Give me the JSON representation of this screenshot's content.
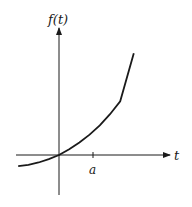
{
  "chart_data": {
    "type": "line",
    "title": "",
    "ylabel": "f(t)",
    "xlabel": "t",
    "x_ticks": [
      {
        "label": "a",
        "value": 1
      }
    ],
    "xlim": [
      -1.2,
      2.2
    ],
    "ylim": [
      -0.35,
      3.0
    ],
    "series": [
      {
        "name": "f(t)",
        "description": "increasing convex curve passing through origin",
        "x": [
          -1.2,
          -0.9,
          -0.6,
          -0.3,
          0,
          0.3,
          0.6,
          0.9,
          1.2,
          1.5,
          1.8,
          2.2
        ],
        "y": [
          -0.33,
          -0.29,
          -0.22,
          -0.12,
          0,
          0.17,
          0.37,
          0.6,
          0.87,
          1.2,
          1.58,
          2.99
        ]
      }
    ],
    "grid": false,
    "legend": "none"
  },
  "labels": {
    "y_axis": "f(t)",
    "x_axis": "t",
    "tick_a": "a"
  }
}
